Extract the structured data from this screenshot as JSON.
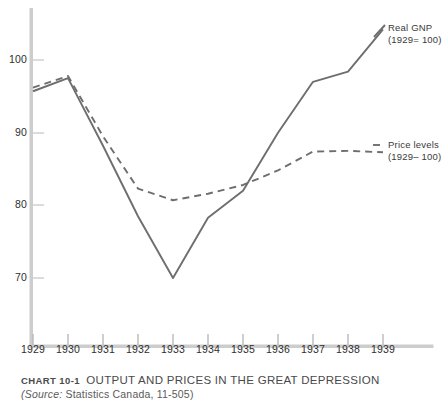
{
  "chart_data": {
    "type": "line",
    "title": "OUTPUT AND PRICES IN THE GREAT DEPRESSION",
    "chart_number": "CHART 10-1",
    "source_label": "(Source:",
    "source_value": "Statistics Canada, 11-505)",
    "xlabel": "",
    "ylabel": "",
    "x": [
      1929,
      1930,
      1931,
      1932,
      1933,
      1934,
      1935,
      1936,
      1937,
      1938,
      1939
    ],
    "categories": [
      "1929",
      "1930",
      "1931",
      "1932",
      "1933",
      "1934",
      "1935",
      "1936",
      "1937",
      "1938",
      "1939"
    ],
    "xlim": [
      1929,
      1939
    ],
    "ylim": [
      62,
      106
    ],
    "yticks": [
      70,
      80,
      90,
      100
    ],
    "ytick_labels": [
      "70",
      "80",
      "90",
      "100"
    ],
    "grid": false,
    "legend_position": "right",
    "series": [
      {
        "name": "Real GNP",
        "basis": "(1929= 100)",
        "style": "solid",
        "color": "#6e6e6e",
        "values": [
          95.7,
          97.5,
          88.2,
          78.5,
          70.0,
          78.3,
          82.0,
          90.0,
          97.0,
          98.4,
          104.2
        ]
      },
      {
        "name": "Price levels",
        "basis": "(1929= 100)",
        "style": "dashed",
        "color": "#6e6e6e",
        "values": [
          96.2,
          97.8,
          89.5,
          82.3,
          80.7,
          81.6,
          82.8,
          84.8,
          87.4,
          87.5,
          87.3
        ]
      }
    ]
  },
  "axis": {
    "y_axis_color": "#c9c9c9",
    "x_axis_color": "#c9c9c9",
    "tick_color": "#b5b5b5"
  },
  "legend": {
    "real_gnp": {
      "line_1": "Real  GNP",
      "line_2": "(1929= 100)"
    },
    "price_levels": {
      "line_1": "Price levels",
      "line_2": "(1929– 100)"
    }
  }
}
